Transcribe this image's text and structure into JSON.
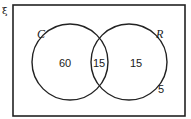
{
  "diagram": {
    "type": "venn",
    "universal_symbol": "ξ",
    "sets": [
      {
        "name": "C",
        "only": "60"
      },
      {
        "name": "R",
        "only": "15"
      }
    ],
    "intersection": "15",
    "outside": "5"
  }
}
